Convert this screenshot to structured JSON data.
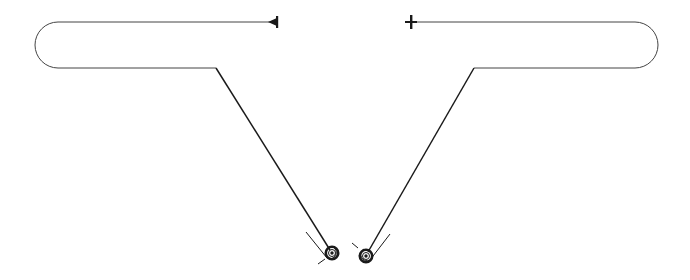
{
  "figure": {
    "domain": "diagram",
    "kind": "technical-line-drawing",
    "background_color": "#ffffff",
    "ink_color": "#1a1a1a",
    "ink_color_light": "#555555",
    "canvas": {
      "width": 690,
      "height": 280
    },
    "has_text": false,
    "has_axes": false,
    "has_legend": false,
    "symmetry": "bilateral-vertical",
    "symmetry_axis_x": 345
  },
  "geometry": {
    "top_rail_y": 22,
    "bottom_rail_y": 68,
    "left_cap_x": 35,
    "right_cap_x": 658,
    "left_bend_vertex": {
      "x": 216,
      "y": 68
    },
    "right_bend_vertex": {
      "x": 474,
      "y": 68
    },
    "left_arrow_tip": {
      "x": 277,
      "y": 22
    },
    "right_cross_center": {
      "x": 411,
      "y": 22
    },
    "left_ring_center": {
      "x": 332,
      "y": 253
    },
    "right_ring_center": {
      "x": 366,
      "y": 256
    },
    "ring_outer_radius": 6.5,
    "ring_inner_radius": 3.6,
    "ring_hub_radius": 1.8,
    "stroke_width_thin": 1,
    "stroke_width_diagonal": 1.5
  },
  "elements": {
    "left_hairpin_label": "left hairpin loop",
    "right_hairpin_label": "right hairpin loop",
    "left_diagonal_label": "left descending diagonal",
    "right_diagonal_label": "right descending diagonal",
    "left_terminal_label": "left terminal ring assembly",
    "right_terminal_label": "right terminal ring assembly",
    "arrow_marker_label": "arrowhead terminator",
    "cross_marker_label": "cross terminator"
  }
}
